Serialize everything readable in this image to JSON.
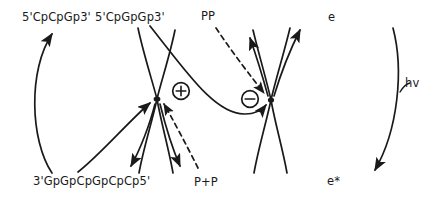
{
  "diagram": {
    "type": "reaction-scheme",
    "background_color": "#ffffff",
    "stroke_color": "#1a1a1a",
    "labels": {
      "top_left_sequence": "5'CpCpGp3'",
      "top_mid_sequence": "5'CpGpGp3'",
      "pp_label": "PP",
      "electron_label": "e",
      "bottom_left_sequence": "3'GpGpCpGpCpCp5'",
      "p_plus_p_label": "P+P",
      "electron_excited_label": "e*",
      "photon_label": "hv"
    },
    "nodes": [
      {
        "name": "positive-charge-node",
        "symbol": "+",
        "x": 181,
        "y": 91
      },
      {
        "name": "negative-charge-node",
        "symbol": "−",
        "x": 250,
        "y": 99
      }
    ],
    "crossing_points": [
      {
        "name": "left-crossing",
        "x": 157,
        "y": 99
      },
      {
        "name": "right-crossing",
        "x": 271,
        "y": 100
      }
    ]
  }
}
